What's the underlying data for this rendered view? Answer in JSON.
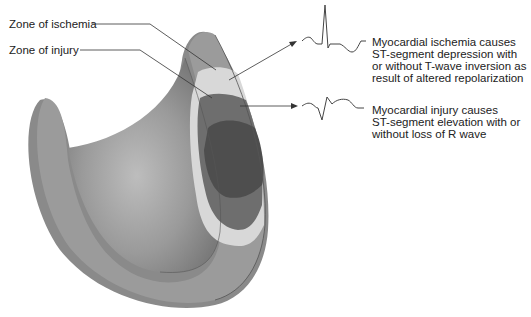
{
  "labels": {
    "ischemia_zone": "Zone of ischemia",
    "injury_zone": "Zone of injury"
  },
  "descriptions": {
    "ischemia": {
      "lines": [
        "Myocardial ischemia causes",
        "ST-segment depression with",
        "or without T-wave inversion as",
        "result of altered repolarization"
      ]
    },
    "injury": {
      "lines": [
        "Myocardial injury causes",
        "ST-segment elevation with or",
        "without loss of R wave"
      ]
    }
  },
  "icons": {
    "ecg_ischemia": "ecg-st-depression-icon",
    "ecg_injury": "ecg-st-elevation-icon"
  },
  "colors": {
    "wall_outer": "#8a8a8a",
    "wall_inner": "#a0a0a0",
    "ischemia_zone": "#d8d8d8",
    "injury_zone": "#6e6e6e",
    "infarct_core": "#4e4e4e",
    "line": "#333333"
  }
}
